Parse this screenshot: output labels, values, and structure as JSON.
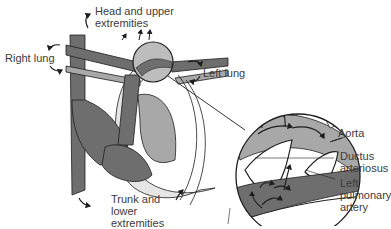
{
  "diagram": {
    "topic": "Fetal circulation through the ductus arteriosus",
    "labels": {
      "head_line1": "Head and upper",
      "head_line2": "extremities",
      "right_lung": "Right lung",
      "left_lung": "Left lung",
      "trunk_line1": "Trunk and",
      "trunk_line2": "lower",
      "trunk_line3": "extremities",
      "aorta": "Aorta",
      "ductus_line1": "Ductus",
      "ductus_line2": "arteriosus",
      "lpa_line1": "Left",
      "lpa_line2": "pulmonary",
      "lpa_line3": "artery"
    },
    "colors": {
      "dark_vessel": "#6e6e6e",
      "light_vessel": "#a8a8a8",
      "outline": "#1e1e1e",
      "background": "#ffffff"
    }
  }
}
